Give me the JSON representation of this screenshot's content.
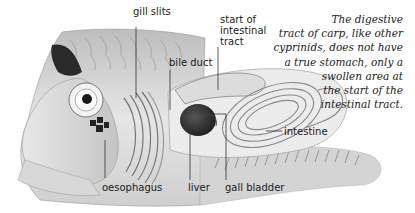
{
  "figure": {
    "labels": {
      "gill_slits": "gill slits",
      "start_of_intestinal_tract": [
        "start of",
        "intestinal",
        "tract"
      ],
      "bile_duct": "bile duct",
      "intestine": "intestine",
      "oesophagus": "oesophagus",
      "liver": "liver",
      "gall_bladder": "gall bladder"
    },
    "caption_lines": [
      "The digestive",
      "tract of carp, like other",
      "cyprinids, does not have",
      "a true stomach, only a",
      "swollen area at",
      "the start of the",
      "intestinal tract."
    ]
  }
}
